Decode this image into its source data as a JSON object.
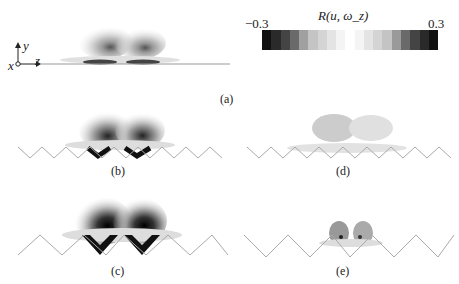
{
  "figure": {
    "colorbar": {
      "title": "R(u, ω_z)",
      "min_label": "−0.3",
      "max_label": "0.3",
      "range": [
        -0.3,
        0.3
      ],
      "colors": [
        "#111111",
        "#2a2a2a",
        "#444444",
        "#6a6a6a",
        "#a0a0a0",
        "#c4c4c4",
        "#d4d4d4",
        "#e4e4e4",
        "#f4f4f4",
        "#ffffff",
        "#f4f4f4",
        "#e4e4e4",
        "#d4d4d4",
        "#c4c4c4",
        "#9a9a9a",
        "#6a6a6a",
        "#444444",
        "#2a2a2a",
        "#111111"
      ]
    },
    "axes_glyph": {
      "x_label": "x",
      "y_label": "y",
      "z_label": "z"
    },
    "panels": [
      {
        "id": "a",
        "label": "(a)",
        "wall": "flat"
      },
      {
        "id": "b",
        "label": "(b)",
        "wall": "riblets-small"
      },
      {
        "id": "c",
        "label": "(c)",
        "wall": "riblets-large"
      },
      {
        "id": "d",
        "label": "(d)",
        "wall": "riblets-small"
      },
      {
        "id": "e",
        "label": "(e)",
        "wall": "riblets-large"
      }
    ]
  }
}
